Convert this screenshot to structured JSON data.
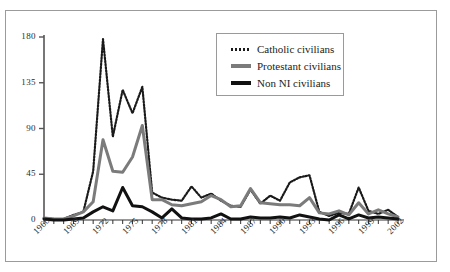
{
  "figure": {
    "background_color": "#ffffff",
    "frame_color": "#9b9b9b",
    "cropped_header_text": ""
  },
  "legend": {
    "position": "top-center-right",
    "entries": [
      {
        "label": "Catholic civilians",
        "style": "dotted",
        "color": "#1a1a1a"
      },
      {
        "label": "Protestant civilians",
        "style": "solid",
        "color": "#7b7b7b"
      },
      {
        "label": "Non NI civilians",
        "style": "solid",
        "color": "#111111"
      }
    ]
  },
  "axes": {
    "y_ticks": [
      "180",
      "135",
      "90",
      "45",
      "0"
    ],
    "x_ticks": [
      "1966",
      "1969",
      "1972",
      "1975",
      "1978",
      "1981",
      "1984",
      "1987",
      "1990",
      "1993",
      "1996",
      "1999",
      "2002"
    ]
  },
  "chart_data": {
    "type": "line",
    "title": "",
    "subtitle": "",
    "xlabel": "",
    "ylabel": "",
    "xlim": [
      1966,
      2002
    ],
    "ylim": [
      0,
      180
    ],
    "ytick_values": [
      0,
      45,
      90,
      135,
      180
    ],
    "xtick_values": [
      1966,
      1969,
      1972,
      1975,
      1978,
      1981,
      1984,
      1987,
      1990,
      1993,
      1996,
      1999,
      2002
    ],
    "grid": false,
    "legend_position": "upper center",
    "x": [
      1966,
      1967,
      1968,
      1969,
      1970,
      1971,
      1972,
      1973,
      1974,
      1975,
      1976,
      1977,
      1978,
      1979,
      1980,
      1981,
      1982,
      1983,
      1984,
      1985,
      1986,
      1987,
      1988,
      1989,
      1990,
      1991,
      1992,
      1993,
      1994,
      1995,
      1996,
      1997,
      1998,
      1999,
      2000,
      2001,
      2002
    ],
    "series": [
      {
        "name": "Catholic civilians",
        "color": "#1a1a1a",
        "style": "dotted",
        "values": [
          2,
          1,
          1,
          5,
          8,
          48,
          178,
          82,
          128,
          105,
          131,
          27,
          22,
          20,
          19,
          33,
          22,
          26,
          19,
          14,
          13,
          30,
          16,
          24,
          19,
          37,
          42,
          44,
          8,
          4,
          7,
          6,
          32,
          9,
          6,
          10,
          3
        ]
      },
      {
        "name": "Protestant civilians",
        "color": "#7b7b7b",
        "style": "solid",
        "values": [
          2,
          1,
          1,
          4,
          8,
          18,
          79,
          48,
          47,
          62,
          93,
          20,
          20,
          15,
          14,
          16,
          18,
          24,
          20,
          13,
          14,
          31,
          17,
          16,
          15,
          15,
          14,
          22,
          7,
          6,
          9,
          5,
          17,
          6,
          10,
          6,
          3
        ]
      },
      {
        "name": "Non NI civilians",
        "color": "#111111",
        "style": "solid",
        "values": [
          1,
          0,
          0,
          1,
          2,
          8,
          13,
          9,
          32,
          14,
          13,
          8,
          2,
          11,
          2,
          1,
          1,
          2,
          6,
          1,
          1,
          3,
          2,
          2,
          3,
          2,
          5,
          3,
          1,
          0,
          5,
          1,
          5,
          2,
          3,
          2,
          1
        ]
      }
    ]
  }
}
